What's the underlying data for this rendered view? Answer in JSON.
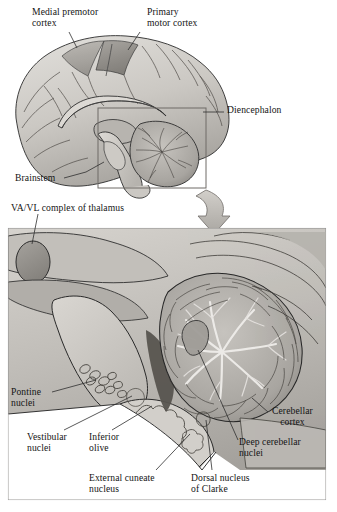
{
  "figure": {
    "background": "#ffffff",
    "ink": "#1a1a1a"
  },
  "palette": {
    "ink": "#1a1a1a",
    "leader_line": "#3a3a3a",
    "panel_border": "#8d8d8d",
    "cortex_light": "#d8d6d2",
    "cortex_mid": "#bdbab5",
    "cortex_dark": "#9b9893",
    "premotor_shade": "#a9a6a1",
    "motor_shade": "#8e8b86",
    "brainstem_fill": "#cfccc7",
    "cerebellum_fill": "#b5b2ad",
    "cerebellum_dark": "#8a8782",
    "thalamus_fill": "#9d9a95",
    "inset_bg": "#c9c6c1",
    "inset_deep": "#6f6c68",
    "arrow_fill": "#b9b6b1",
    "white": "#ffffff"
  },
  "top_panel": {
    "name": "midsagittal-brain-overview",
    "labels": [
      {
        "id": "medial-premotor-cortex",
        "lines": [
          "Medial premotor",
          "cortex"
        ],
        "x": 32,
        "y": 8,
        "leader": "up-right-tick"
      },
      {
        "id": "primary-motor-cortex",
        "lines": [
          "Primary",
          "motor cortex"
        ],
        "x": 148,
        "y": 8,
        "leader": "up-left-tick"
      },
      {
        "id": "diencephalon",
        "lines": [
          "Diencephalon"
        ],
        "x": 228,
        "y": 103,
        "leader": "dash-left"
      },
      {
        "id": "brainstem",
        "lines": [
          "Brainstem"
        ],
        "x": 16,
        "y": 172,
        "leader": "line-right-up"
      }
    ],
    "inset_rect": {
      "x": 98,
      "y": 108,
      "w": 108,
      "h": 80
    },
    "arrow": {
      "from_x": 208,
      "from_y": 190,
      "to_x": 214,
      "to_y": 226
    }
  },
  "bottom_panel": {
    "name": "cerebellum-brainstem-detail",
    "panel_rect": {
      "x": 8,
      "y": 228,
      "w": 318,
      "h": 272
    },
    "labels": [
      {
        "id": "va-vl-complex-of-thalamus",
        "lines": [
          "VA/VL complex of thalamus"
        ],
        "x": 12,
        "y": 204
      },
      {
        "id": "pontine-nuclei",
        "lines": [
          "Pontine",
          "nuclei"
        ],
        "x": 12,
        "y": 388
      },
      {
        "id": "vestibular-nuclei",
        "lines": [
          "Vestibular",
          "nuclei"
        ],
        "x": 28,
        "y": 433
      },
      {
        "id": "inferior-olive",
        "lines": [
          "Inferior",
          "olive"
        ],
        "x": 90,
        "y": 433
      },
      {
        "id": "external-cuneate-nucleus",
        "lines": [
          "External cuneate",
          "nucleus"
        ],
        "x": 90,
        "y": 474
      },
      {
        "id": "dorsal-nucleus-of-clarke",
        "lines": [
          "Dorsal nucleus",
          "of Clarke"
        ],
        "x": 192,
        "y": 474
      },
      {
        "id": "cerebellar-cortex",
        "lines": [
          "Cerebellar",
          "cortex"
        ],
        "x": 270,
        "y": 407
      },
      {
        "id": "deep-cerebellar-nuclei",
        "lines": [
          "Deep cerebellar",
          "nuclei"
        ],
        "x": 240,
        "y": 437
      }
    ],
    "structures": [
      "VA/VL complex of thalamus",
      "Pontine nuclei",
      "Vestibular nuclei",
      "Inferior olive",
      "External cuneate nucleus",
      "Dorsal nucleus of Clarke",
      "Cerebellar cortex",
      "Deep cerebellar nuclei"
    ]
  }
}
